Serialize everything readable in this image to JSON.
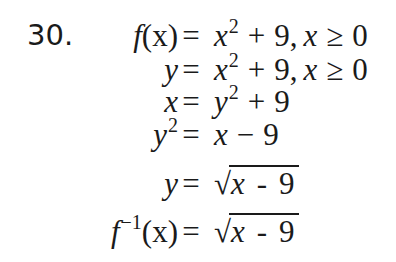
{
  "problem": {
    "number": "30.",
    "steps": [
      {
        "lhs_fn": "f",
        "lhs_arg": "(x)",
        "eq": "=",
        "rhs_var": "x",
        "rhs_exp": "2",
        "rhs_op": "+",
        "rhs_const": "9,",
        "cond_var": "x",
        "cond_op": "≥",
        "cond_val": "0"
      },
      {
        "lhs": "y",
        "eq": "=",
        "rhs_var": "x",
        "rhs_exp": "2",
        "rhs_op": "+",
        "rhs_const": "9,",
        "cond_var": "x",
        "cond_op": "≥",
        "cond_val": "0"
      },
      {
        "lhs": "x",
        "eq": "=",
        "rhs_var": "y",
        "rhs_exp": "2",
        "rhs_op": "+",
        "rhs_const": "9"
      },
      {
        "lhs": "y",
        "lhs_exp": "2",
        "eq": "=",
        "rhs_var": "x",
        "rhs_op": "−",
        "rhs_const": "9"
      },
      {
        "lhs": "y",
        "eq": "=",
        "radical": "√",
        "rhs_var": "x",
        "rhs_op": "-",
        "rhs_const": "9"
      },
      {
        "lhs_fn": "f",
        "lhs_exp": "−1",
        "lhs_arg": "(x)",
        "eq": "=",
        "radical": "√",
        "rhs_var": "x",
        "rhs_op": "-",
        "rhs_const": "9"
      }
    ]
  }
}
